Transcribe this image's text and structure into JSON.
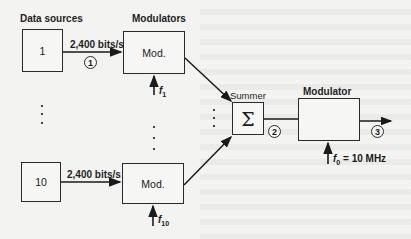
{
  "diagram": {
    "labels": {
      "data_sources": "Data sources",
      "modulators": "Modulators",
      "summer": "Summer",
      "modulator": "Modulator"
    },
    "sources": [
      {
        "label": "1",
        "rate": "2,400 bits/s",
        "mod_label": "Mod.",
        "freq": "f",
        "freq_sub": "1"
      },
      {
        "label": "10",
        "rate": "2,400 bits/s",
        "mod_label": "Mod.",
        "freq": "f",
        "freq_sub": "10"
      }
    ],
    "summer_symbol": "Σ",
    "carrier": {
      "freq": "f",
      "freq_sub": "0",
      "value": " = 10 MHz"
    },
    "points": [
      "1",
      "2",
      "3"
    ]
  }
}
